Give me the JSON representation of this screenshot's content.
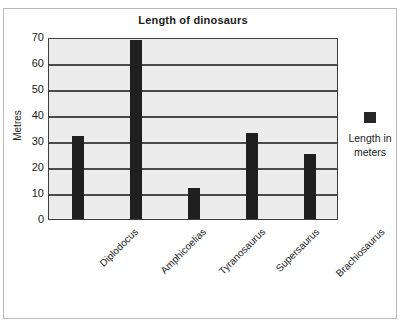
{
  "chart_data": {
    "type": "bar",
    "title": "Length of dinosaurs",
    "xlabel": "",
    "ylabel": "Metres",
    "categories": [
      "Diplodocus",
      "Amphicoelias",
      "Tyranosaurus",
      "Supersaurus",
      "Brachiosaurus"
    ],
    "values": [
      32,
      69,
      12,
      33,
      25
    ],
    "series": [
      {
        "name": "Length in meters",
        "values": [
          32,
          69,
          12,
          33,
          25
        ],
        "color": "#1f1f1f"
      }
    ],
    "ylim": [
      0,
      70
    ],
    "ytick_labels": [
      "70",
      "60",
      "50",
      "40",
      "30",
      "20",
      "10",
      "0"
    ],
    "ytick_values": [
      70,
      60,
      50,
      40,
      30,
      20,
      10,
      0
    ],
    "grid": true,
    "grid_axis": "y",
    "legend_position": "right",
    "legend_entries": [
      "Length in meters"
    ],
    "plot_background": "#ececec",
    "gridline_color": "#4a4a4a",
    "axis_color": "#3d3d3d"
  },
  "legend": {
    "label_line1": "Length in",
    "label_line2": "meters",
    "swatch_color": "#262626"
  }
}
